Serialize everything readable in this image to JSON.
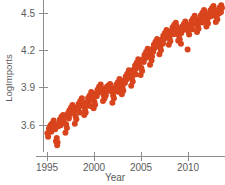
{
  "chart_data": {
    "type": "scatter",
    "title": "",
    "subtitle": "",
    "xlabel": "Year",
    "ylabel": "LogImports",
    "xlim": [
      1994.6,
      2013.6
    ],
    "ylim": [
      3.42,
      4.6
    ],
    "xticks": [
      1995,
      2000,
      2005,
      2010
    ],
    "xtick_labels": [
      "1995",
      "2000",
      "2005",
      "2010"
    ],
    "yticks": [
      3.6,
      3.9,
      4.2,
      4.5
    ],
    "ytick_labels": [
      "3.6",
      "3.9",
      "4.2",
      "4.5"
    ],
    "grid": false,
    "legend": false,
    "legend_position": "none",
    "marker": {
      "shape": "circle",
      "color": "#d8441c",
      "size": 3.0,
      "opacity": 1.0
    },
    "series": [
      {
        "name": "LogImports",
        "color": "#d8441c",
        "points": [
          [
            1995.04,
            3.533
          ],
          [
            1995.12,
            3.505
          ],
          [
            1995.21,
            3.572
          ],
          [
            1995.29,
            3.556
          ],
          [
            1995.37,
            3.598
          ],
          [
            1995.46,
            3.545
          ],
          [
            1995.54,
            3.612
          ],
          [
            1995.62,
            3.586
          ],
          [
            1995.71,
            3.637
          ],
          [
            1995.79,
            3.601
          ],
          [
            1995.87,
            3.566
          ],
          [
            1995.96,
            3.47
          ],
          [
            1996.04,
            3.496
          ],
          [
            1996.12,
            3.462
          ],
          [
            1996.21,
            3.59
          ],
          [
            1996.29,
            3.618
          ],
          [
            1996.37,
            3.644
          ],
          [
            1996.46,
            3.598
          ],
          [
            1996.54,
            3.666
          ],
          [
            1996.62,
            3.64
          ],
          [
            1996.71,
            3.681
          ],
          [
            1996.79,
            3.655
          ],
          [
            1996.87,
            3.616
          ],
          [
            1996.96,
            3.538
          ],
          [
            1997.04,
            3.604
          ],
          [
            1997.12,
            3.576
          ],
          [
            1997.21,
            3.693
          ],
          [
            1997.29,
            3.671
          ],
          [
            1997.37,
            3.716
          ],
          [
            1997.46,
            3.688
          ],
          [
            1997.54,
            3.738
          ],
          [
            1997.62,
            3.709
          ],
          [
            1997.71,
            3.76
          ],
          [
            1997.79,
            3.724
          ],
          [
            1997.87,
            3.703
          ],
          [
            1997.96,
            3.611
          ],
          [
            1998.04,
            3.668
          ],
          [
            1998.12,
            3.646
          ],
          [
            1998.21,
            3.742
          ],
          [
            1998.29,
            3.725
          ],
          [
            1998.37,
            3.771
          ],
          [
            1998.46,
            3.749
          ],
          [
            1998.54,
            3.792
          ],
          [
            1998.62,
            3.764
          ],
          [
            1998.71,
            3.814
          ],
          [
            1998.79,
            3.782
          ],
          [
            1998.87,
            3.757
          ],
          [
            1998.96,
            3.681
          ],
          [
            1999.04,
            3.722
          ],
          [
            1999.12,
            3.7
          ],
          [
            1999.21,
            3.78
          ],
          [
            1999.29,
            3.761
          ],
          [
            1999.37,
            3.816
          ],
          [
            1999.46,
            3.79
          ],
          [
            1999.54,
            3.838
          ],
          [
            1999.62,
            3.812
          ],
          [
            1999.71,
            3.866
          ],
          [
            1999.79,
            3.835
          ],
          [
            1999.87,
            3.808
          ],
          [
            1999.96,
            3.735
          ],
          [
            2000.04,
            3.786
          ],
          [
            2000.12,
            3.762
          ],
          [
            2000.21,
            3.854
          ],
          [
            2000.29,
            3.832
          ],
          [
            2000.37,
            3.884
          ],
          [
            2000.46,
            3.86
          ],
          [
            2000.54,
            3.908
          ],
          [
            2000.62,
            3.879
          ],
          [
            2000.71,
            3.926
          ],
          [
            2000.79,
            3.898
          ],
          [
            2000.87,
            3.866
          ],
          [
            2000.96,
            3.792
          ],
          [
            2001.04,
            3.84
          ],
          [
            2001.12,
            3.812
          ],
          [
            2001.21,
            3.884
          ],
          [
            2001.29,
            3.866
          ],
          [
            2001.37,
            3.908
          ],
          [
            2001.46,
            3.882
          ],
          [
            2001.54,
            3.918
          ],
          [
            2001.62,
            3.894
          ],
          [
            2001.71,
            3.93
          ],
          [
            2001.79,
            3.902
          ],
          [
            2001.87,
            3.87
          ],
          [
            2001.96,
            3.778
          ],
          [
            2002.04,
            3.836
          ],
          [
            2002.12,
            3.814
          ],
          [
            2002.21,
            3.896
          ],
          [
            2002.29,
            3.874
          ],
          [
            2002.37,
            3.924
          ],
          [
            2002.46,
            3.898
          ],
          [
            2002.54,
            3.944
          ],
          [
            2002.62,
            3.918
          ],
          [
            2002.71,
            3.97
          ],
          [
            2002.79,
            3.94
          ],
          [
            2002.87,
            3.912
          ],
          [
            2002.96,
            3.848
          ],
          [
            2003.04,
            3.9
          ],
          [
            2003.12,
            3.876
          ],
          [
            2003.21,
            3.958
          ],
          [
            2003.29,
            3.938
          ],
          [
            2003.37,
            3.99
          ],
          [
            2003.46,
            3.966
          ],
          [
            2003.54,
            4.012
          ],
          [
            2003.62,
            3.988
          ],
          [
            2003.71,
            4.04
          ],
          [
            2003.79,
            4.01
          ],
          [
            2003.87,
            3.984
          ],
          [
            2003.96,
            3.916
          ],
          [
            2004.04,
            3.972
          ],
          [
            2004.12,
            3.95
          ],
          [
            2004.21,
            4.044
          ],
          [
            2004.29,
            4.022
          ],
          [
            2004.37,
            4.078
          ],
          [
            2004.46,
            4.052
          ],
          [
            2004.54,
            4.1
          ],
          [
            2004.62,
            4.074
          ],
          [
            2004.71,
            4.128
          ],
          [
            2004.79,
            4.098
          ],
          [
            2004.87,
            4.07
          ],
          [
            2004.96,
            4.002
          ],
          [
            2005.04,
            4.058
          ],
          [
            2005.12,
            4.034
          ],
          [
            2005.21,
            4.128
          ],
          [
            2005.29,
            4.106
          ],
          [
            2005.37,
            4.162
          ],
          [
            2005.46,
            4.136
          ],
          [
            2005.54,
            4.186
          ],
          [
            2005.62,
            4.158
          ],
          [
            2005.71,
            4.212
          ],
          [
            2005.79,
            4.182
          ],
          [
            2005.87,
            4.154
          ],
          [
            2005.96,
            4.084
          ],
          [
            2006.04,
            4.142
          ],
          [
            2006.12,
            4.118
          ],
          [
            2006.21,
            4.21
          ],
          [
            2006.29,
            4.188
          ],
          [
            2006.37,
            4.244
          ],
          [
            2006.46,
            4.218
          ],
          [
            2006.54,
            4.268
          ],
          [
            2006.62,
            4.24
          ],
          [
            2006.71,
            4.292
          ],
          [
            2006.79,
            4.262
          ],
          [
            2006.87,
            4.234
          ],
          [
            2006.96,
            4.168
          ],
          [
            2007.04,
            4.224
          ],
          [
            2007.12,
            4.2
          ],
          [
            2007.21,
            4.286
          ],
          [
            2007.29,
            4.264
          ],
          [
            2007.37,
            4.318
          ],
          [
            2007.46,
            4.292
          ],
          [
            2007.54,
            4.34
          ],
          [
            2007.62,
            4.314
          ],
          [
            2007.71,
            4.364
          ],
          [
            2007.79,
            4.336
          ],
          [
            2007.87,
            4.308
          ],
          [
            2007.96,
            4.244
          ],
          [
            2008.04,
            4.296
          ],
          [
            2008.12,
            4.272
          ],
          [
            2008.21,
            4.356
          ],
          [
            2008.29,
            4.334
          ],
          [
            2008.37,
            4.386
          ],
          [
            2008.46,
            4.36
          ],
          [
            2008.54,
            4.406
          ],
          [
            2008.62,
            4.38
          ],
          [
            2008.71,
            4.422
          ],
          [
            2008.79,
            4.392
          ],
          [
            2008.87,
            4.356
          ],
          [
            2008.96,
            4.278
          ],
          [
            2009.04,
            4.318
          ],
          [
            2009.12,
            4.29
          ],
          [
            2009.21,
            4.364
          ],
          [
            2009.29,
            4.34
          ],
          [
            2009.37,
            4.39
          ],
          [
            2009.46,
            4.364
          ],
          [
            2009.54,
            4.41
          ],
          [
            2009.62,
            4.384
          ],
          [
            2009.71,
            4.432
          ],
          [
            2009.79,
            4.404
          ],
          [
            2009.87,
            4.372
          ],
          [
            2009.96,
            4.206
          ],
          [
            2010.04,
            4.352
          ],
          [
            2010.12,
            4.328
          ],
          [
            2010.21,
            4.406
          ],
          [
            2010.29,
            4.384
          ],
          [
            2010.37,
            4.436
          ],
          [
            2010.46,
            4.41
          ],
          [
            2010.54,
            4.456
          ],
          [
            2010.62,
            4.43
          ],
          [
            2010.71,
            4.478
          ],
          [
            2010.79,
            4.45
          ],
          [
            2010.87,
            4.42
          ],
          [
            2010.96,
            4.348
          ],
          [
            2011.04,
            4.398
          ],
          [
            2011.12,
            4.374
          ],
          [
            2011.21,
            4.452
          ],
          [
            2011.29,
            4.43
          ],
          [
            2011.37,
            4.482
          ],
          [
            2011.46,
            4.456
          ],
          [
            2011.54,
            4.502
          ],
          [
            2011.62,
            4.476
          ],
          [
            2011.71,
            4.524
          ],
          [
            2011.79,
            4.496
          ],
          [
            2011.87,
            4.466
          ],
          [
            2011.96,
            4.392
          ],
          [
            2012.04,
            4.44
          ],
          [
            2012.12,
            4.416
          ],
          [
            2012.21,
            4.492
          ],
          [
            2012.29,
            4.47
          ],
          [
            2012.37,
            4.52
          ],
          [
            2012.46,
            4.494
          ],
          [
            2012.54,
            4.538
          ],
          [
            2012.62,
            4.512
          ],
          [
            2012.71,
            4.556
          ],
          [
            2012.79,
            4.528
          ],
          [
            2012.87,
            4.498
          ],
          [
            2012.96,
            4.428
          ],
          [
            2013.04,
            4.47
          ],
          [
            2013.12,
            4.448
          ],
          [
            2013.21,
            4.518
          ],
          [
            2013.29,
            4.496
          ],
          [
            2013.37,
            4.544
          ],
          [
            2013.46,
            4.522
          ],
          [
            2013.54,
            4.562
          ],
          [
            2013.62,
            4.54
          ],
          [
            1996.08,
            3.438
          ],
          [
            1997.33,
            3.652
          ],
          [
            1998.5,
            3.7
          ],
          [
            1999.58,
            3.752
          ],
          [
            2001.25,
            3.838
          ],
          [
            2002.58,
            3.868
          ],
          [
            2004.42,
            4.006
          ],
          [
            2006.17,
            4.15
          ],
          [
            2007.33,
            4.252
          ],
          [
            2008.5,
            4.33
          ],
          [
            2009.25,
            4.252
          ],
          [
            2010.5,
            4.37
          ],
          [
            2011.5,
            4.424
          ],
          [
            2012.5,
            4.476
          ],
          [
            2013.5,
            4.506
          ]
        ]
      }
    ]
  },
  "axes": {
    "x_axis_name": "year-axis",
    "y_axis_name": "logimports-axis"
  }
}
